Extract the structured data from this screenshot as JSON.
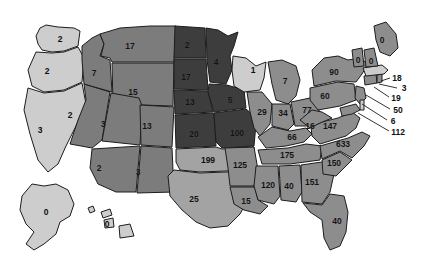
{
  "chart_data": {
    "type": "map",
    "subtype": "choropleth",
    "title": "",
    "xlabel": "",
    "ylabel": "",
    "region": "United States",
    "grid": false,
    "legend": "none",
    "value_range": [
      0,
      633
    ],
    "color_scale": {
      "type": "sequential-gray",
      "bins": [
        {
          "max": 3,
          "color": "#cdcdcd"
        },
        {
          "max": 17,
          "color": "#7c7c7c"
        },
        {
          "max": 29,
          "color": "#a3a3a3"
        },
        {
          "max": 100,
          "color": "#3d3d3d"
        },
        {
          "max": 633,
          "color": "#8d8d8d"
        }
      ]
    },
    "background": "#ffffff",
    "border_color": "#1d1d1d",
    "categories": [
      "WA",
      "OR",
      "CA",
      "NV",
      "ID",
      "MT",
      "WY",
      "UT",
      "AZ",
      "NM",
      "CO",
      "ND",
      "SD",
      "NE",
      "KS",
      "OK",
      "TX",
      "MN",
      "IA",
      "MO",
      "AR",
      "LA",
      "WI",
      "IL",
      "MI",
      "IN",
      "OH",
      "KY",
      "TN",
      "MS",
      "AL",
      "GA",
      "FL",
      "SC",
      "NC",
      "VA",
      "WV",
      "MD",
      "DE",
      "PA",
      "NJ",
      "NY",
      "CT",
      "RI",
      "MA",
      "VT",
      "NH",
      "ME",
      "AK",
      "HI"
    ],
    "values": [
      2,
      2,
      3,
      2,
      7,
      17,
      15,
      3,
      2,
      3,
      13,
      2,
      17,
      13,
      20,
      199,
      25,
      4,
      5,
      100,
      125,
      15,
      1,
      29,
      7,
      34,
      77,
      66,
      175,
      120,
      40,
      151,
      40,
      150,
      633,
      147,
      16,
      112,
      6,
      60,
      50,
      90,
      19,
      3,
      18,
      0,
      0,
      0,
      0,
      0
    ],
    "labels": [
      {
        "name": "washington",
        "abbr": "WA",
        "value": "2",
        "x": 60,
        "y": 39,
        "shade": "light"
      },
      {
        "name": "oregon",
        "abbr": "OR",
        "value": "2",
        "x": 47,
        "y": 71,
        "shade": "light"
      },
      {
        "name": "california",
        "abbr": "CA",
        "value": "3",
        "x": 40,
        "y": 130,
        "shade": "light"
      },
      {
        "name": "nevada",
        "abbr": "NV",
        "value": "2",
        "x": 70,
        "y": 115,
        "shade": "mid"
      },
      {
        "name": "idaho",
        "abbr": "ID",
        "value": "7",
        "x": 94,
        "y": 73,
        "shade": "mid"
      },
      {
        "name": "montana",
        "abbr": "MT",
        "value": "17",
        "x": 130,
        "y": 46,
        "shade": "mid"
      },
      {
        "name": "wyoming",
        "abbr": "WY",
        "value": "15",
        "x": 133,
        "y": 92,
        "shade": "mid"
      },
      {
        "name": "utah",
        "abbr": "UT",
        "value": "3",
        "x": 103,
        "y": 124,
        "shade": "mid"
      },
      {
        "name": "arizona",
        "abbr": "AZ",
        "value": "2",
        "x": 99,
        "y": 168,
        "shade": "mid"
      },
      {
        "name": "new-mexico",
        "abbr": "NM",
        "value": "3",
        "x": 138,
        "y": 172,
        "shade": "mid"
      },
      {
        "name": "colorado",
        "abbr": "CO",
        "value": "13",
        "x": 147,
        "y": 126,
        "shade": "mid"
      },
      {
        "name": "north-dakota",
        "abbr": "ND",
        "value": "2",
        "x": 187,
        "y": 45,
        "shade": "dark"
      },
      {
        "name": "south-dakota",
        "abbr": "SD",
        "value": "17",
        "x": 186,
        "y": 77,
        "shade": "dark"
      },
      {
        "name": "nebraska",
        "abbr": "NE",
        "value": "13",
        "x": 190,
        "y": 102,
        "shade": "dark"
      },
      {
        "name": "kansas",
        "abbr": "KS",
        "value": "20",
        "x": 194,
        "y": 134,
        "shade": "dark"
      },
      {
        "name": "oklahoma",
        "abbr": "OK",
        "value": "199",
        "x": 208,
        "y": 160,
        "shade": "light"
      },
      {
        "name": "texas",
        "abbr": "TX",
        "value": "25",
        "x": 194,
        "y": 199,
        "shade": "mid"
      },
      {
        "name": "minnesota",
        "abbr": "MN",
        "value": "4",
        "x": 216,
        "y": 62,
        "shade": "dark"
      },
      {
        "name": "iowa",
        "abbr": "IA",
        "value": "5",
        "x": 230,
        "y": 100,
        "shade": "dark"
      },
      {
        "name": "missouri",
        "abbr": "MO",
        "value": "100",
        "x": 237,
        "y": 133,
        "shade": "dark"
      },
      {
        "name": "arkansas",
        "abbr": "AR",
        "value": "125",
        "x": 240,
        "y": 165,
        "shade": "mid"
      },
      {
        "name": "louisiana",
        "abbr": "LA",
        "value": "15",
        "x": 246,
        "y": 201,
        "shade": "mid"
      },
      {
        "name": "wisconsin",
        "abbr": "WI",
        "value": "1",
        "x": 253,
        "y": 70,
        "shade": "light"
      },
      {
        "name": "illinois",
        "abbr": "IL",
        "value": "29",
        "x": 262,
        "y": 112,
        "shade": "mid"
      },
      {
        "name": "michigan",
        "abbr": "MI",
        "value": "7",
        "x": 285,
        "y": 81,
        "shade": "mid"
      },
      {
        "name": "indiana",
        "abbr": "IN",
        "value": "34",
        "x": 283,
        "y": 113,
        "shade": "mid"
      },
      {
        "name": "ohio",
        "abbr": "OH",
        "value": "77",
        "x": 307,
        "y": 110,
        "shade": "mid"
      },
      {
        "name": "kentucky",
        "abbr": "KY",
        "value": "66",
        "x": 292,
        "y": 137,
        "shade": "mid"
      },
      {
        "name": "tennessee",
        "abbr": "TN",
        "value": "175",
        "x": 287,
        "y": 155,
        "shade": "mid"
      },
      {
        "name": "mississippi",
        "abbr": "MS",
        "value": "120",
        "x": 268,
        "y": 185,
        "shade": "mid"
      },
      {
        "name": "alabama",
        "abbr": "AL",
        "value": "40",
        "x": 289,
        "y": 186,
        "shade": "mid"
      },
      {
        "name": "georgia",
        "abbr": "GA",
        "value": "151",
        "x": 312,
        "y": 182,
        "shade": "mid"
      },
      {
        "name": "florida",
        "abbr": "FL",
        "value": "40",
        "x": 337,
        "y": 221,
        "shade": "mid"
      },
      {
        "name": "south-carolina",
        "abbr": "SC",
        "value": "150",
        "x": 334,
        "y": 163,
        "shade": "mid"
      },
      {
        "name": "north-carolina",
        "abbr": "NC",
        "value": "633",
        "x": 343,
        "y": 144,
        "shade": "mid"
      },
      {
        "name": "virginia",
        "abbr": "VA",
        "value": "147",
        "x": 330,
        "y": 126,
        "shade": "mid"
      },
      {
        "name": "west-virginia",
        "abbr": "WV",
        "value": "16",
        "x": 310,
        "y": 126,
        "shade": "mid"
      },
      {
        "name": "pennsylvania",
        "abbr": "PA",
        "value": "60",
        "x": 325,
        "y": 96,
        "shade": "mid"
      },
      {
        "name": "new-york",
        "abbr": "NY",
        "value": "90",
        "x": 334,
        "y": 72,
        "shade": "mid"
      }
    ],
    "callouts": [
      {
        "name": "massachusetts",
        "abbr": "MA",
        "value": "18",
        "x": 397,
        "y": 78,
        "lx1": 381,
        "ly1": 81,
        "lx2": 390,
        "ly2": 78
      },
      {
        "name": "rhode-island",
        "abbr": "RI",
        "value": "3",
        "x": 404,
        "y": 88,
        "lx1": 379,
        "ly1": 84,
        "lx2": 397,
        "ly2": 88
      },
      {
        "name": "connecticut",
        "abbr": "CT",
        "value": "19",
        "x": 396,
        "y": 98,
        "lx1": 374,
        "ly1": 87,
        "lx2": 389,
        "ly2": 97
      },
      {
        "name": "new-jersey",
        "abbr": "NJ",
        "value": "50",
        "x": 398,
        "y": 110,
        "lx1": 366,
        "ly1": 95,
        "lx2": 390,
        "ly2": 109
      },
      {
        "name": "delaware",
        "abbr": "DE",
        "value": "6",
        "x": 393,
        "y": 121,
        "lx1": 362,
        "ly1": 104,
        "lx2": 387,
        "ly2": 120
      },
      {
        "name": "maryland",
        "abbr": "MD",
        "value": "112",
        "x": 398,
        "y": 132,
        "lx1": 358,
        "ly1": 113,
        "lx2": 389,
        "ly2": 131
      }
    ],
    "small_labels": [
      {
        "name": "maine",
        "abbr": "ME",
        "value": "0",
        "x": 382,
        "y": 40
      },
      {
        "name": "vermont",
        "abbr": "VT",
        "value": "0",
        "x": 358,
        "y": 60
      },
      {
        "name": "new-hampshire",
        "abbr": "NH",
        "value": "0",
        "x": 371,
        "y": 61
      }
    ],
    "inset_labels": [
      {
        "name": "alaska",
        "abbr": "AK",
        "value": "0",
        "x": 46,
        "y": 212
      },
      {
        "name": "hawaii",
        "abbr": "HI",
        "value": "0",
        "x": 107,
        "y": 224
      }
    ]
  }
}
